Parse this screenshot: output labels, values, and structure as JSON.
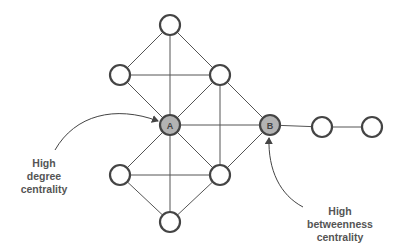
{
  "diagram": {
    "nodes": [
      {
        "id": "top",
        "x": 170,
        "y": 25,
        "label": "",
        "highlight": false
      },
      {
        "id": "upper-left",
        "x": 120,
        "y": 75,
        "label": "",
        "highlight": false
      },
      {
        "id": "upper-right",
        "x": 220,
        "y": 75,
        "label": "",
        "highlight": false
      },
      {
        "id": "A",
        "x": 170,
        "y": 125,
        "label": "A",
        "highlight": true
      },
      {
        "id": "B",
        "x": 270,
        "y": 125,
        "label": "B",
        "highlight": true
      },
      {
        "id": "right-1",
        "x": 322,
        "y": 127,
        "label": "",
        "highlight": false
      },
      {
        "id": "right-2",
        "x": 372,
        "y": 127,
        "label": "",
        "highlight": false
      },
      {
        "id": "lower-left",
        "x": 120,
        "y": 175,
        "label": "",
        "highlight": false
      },
      {
        "id": "lower-right",
        "x": 220,
        "y": 175,
        "label": "",
        "highlight": false
      },
      {
        "id": "bottom",
        "x": 170,
        "y": 222,
        "label": "",
        "highlight": false
      }
    ],
    "edges": [
      [
        "top",
        "upper-left"
      ],
      [
        "top",
        "upper-right"
      ],
      [
        "top",
        "A"
      ],
      [
        "upper-left",
        "upper-right"
      ],
      [
        "upper-left",
        "A"
      ],
      [
        "upper-right",
        "A"
      ],
      [
        "upper-right",
        "B"
      ],
      [
        "upper-right",
        "lower-right"
      ],
      [
        "A",
        "B"
      ],
      [
        "A",
        "lower-left"
      ],
      [
        "A",
        "lower-right"
      ],
      [
        "A",
        "bottom"
      ],
      [
        "lower-left",
        "lower-right"
      ],
      [
        "lower-left",
        "bottom"
      ],
      [
        "lower-right",
        "bottom"
      ],
      [
        "lower-right",
        "B"
      ],
      [
        "B",
        "right-1"
      ],
      [
        "right-1",
        "right-2"
      ]
    ],
    "colors": {
      "node_fill": "#ffffff",
      "node_highlight_fill": "#b3b3b3",
      "stroke": "#444444",
      "edge": "#555555",
      "text": "#555555"
    }
  },
  "annotations": {
    "degree": {
      "line1": "High",
      "line2": "degree",
      "line3": "centrality",
      "points_to": "A"
    },
    "betweenness": {
      "line1": "High",
      "line2": "betweenness",
      "line3": "centrality",
      "points_to": "B"
    }
  }
}
